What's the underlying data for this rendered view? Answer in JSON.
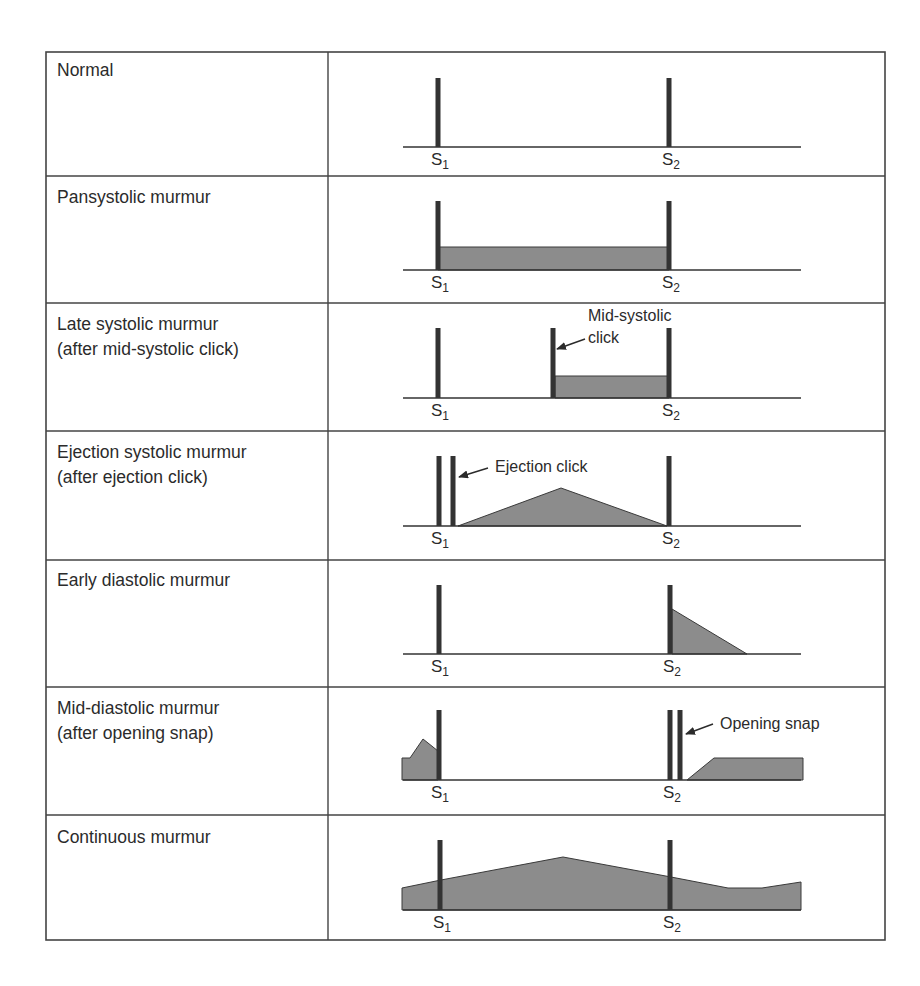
{
  "table": {
    "left": 46,
    "right": 885,
    "top": 52,
    "bottom": 940,
    "divider_x": 328,
    "row_lines": [
      176,
      303,
      431,
      560,
      687,
      815
    ],
    "border_color": "#444444"
  },
  "colors": {
    "bar": "#333333",
    "fill": "#8c8c8c",
    "fill_stroke": "#3a3a3a",
    "baseline": "#333333"
  },
  "rows": [
    {
      "label": "Normal",
      "label_top": 58,
      "baseline_y": 147,
      "bar_top": 78,
      "bars": [
        438,
        669
      ],
      "s1": {
        "text": "S",
        "sub": "1",
        "x": 431
      },
      "s2": {
        "text": "S",
        "sub": "2",
        "x": 662
      },
      "shapes": [],
      "annotations": []
    },
    {
      "label": "Pansystolic murmur",
      "label_top": 185,
      "baseline_y": 270,
      "bar_top": 201,
      "bars": [
        438,
        669
      ],
      "s1": {
        "text": "S",
        "sub": "1",
        "x": 431
      },
      "s2": {
        "text": "S",
        "sub": "2",
        "x": 662
      },
      "shapes": [
        "438,270 438,247 669,247 669,270"
      ],
      "annotations": []
    },
    {
      "label": "Late systolic murmur\n(after mid-systolic click)",
      "label_top": 312,
      "baseline_y": 398,
      "bar_top": 328,
      "bars": [
        438,
        553,
        669
      ],
      "s1": {
        "text": "S",
        "sub": "1",
        "x": 431
      },
      "s2": {
        "text": "S",
        "sub": "2",
        "x": 662
      },
      "shapes": [
        "555,398 555,376 669,376 669,398"
      ],
      "annotations": [
        {
          "text": "Mid-systolic\nclick",
          "x": 588,
          "y": 305,
          "arrow": {
            "x1": 585,
            "y1": 339,
            "x2": 557,
            "y2": 349
          }
        }
      ]
    },
    {
      "label": "Ejection systolic murmur\n(after ejection click)",
      "label_top": 440,
      "baseline_y": 526,
      "bar_top": 456,
      "bars": [
        439,
        453,
        669
      ],
      "s1": {
        "text": "S",
        "sub": "1",
        "x": 431
      },
      "s2": {
        "text": "S",
        "sub": "2",
        "x": 662
      },
      "shapes": [
        "458,526 561,488 667,526"
      ],
      "annotations": [
        {
          "text": "Ejection click",
          "x": 495,
          "y": 456,
          "arrow": {
            "x1": 488,
            "y1": 468,
            "x2": 459,
            "y2": 477
          }
        }
      ]
    },
    {
      "label": "Early diastolic murmur",
      "label_top": 568,
      "baseline_y": 654,
      "bar_top": 585,
      "bars": [
        439,
        670
      ],
      "s1": {
        "text": "S",
        "sub": "1",
        "x": 431
      },
      "s2": {
        "text": "S",
        "sub": "2",
        "x": 663
      },
      "shapes": [
        "672,654 672,609 747,654"
      ],
      "annotations": []
    },
    {
      "label": "Mid-diastolic murmur\n(after opening snap)",
      "label_top": 696,
      "baseline_y": 780,
      "bar_top": 710,
      "bars": [
        439,
        670,
        680
      ],
      "s1": {
        "text": "S",
        "sub": "1",
        "x": 431
      },
      "s2": {
        "text": "S",
        "sub": "2",
        "x": 663
      },
      "shapes": [
        "402,780 402,758 410,758 423,739 438,751 438,780",
        "687,780 714,758 803,758 803,780"
      ],
      "annotations": [
        {
          "text": "Opening snap",
          "x": 720,
          "y": 713,
          "arrow": {
            "x1": 713,
            "y1": 724,
            "x2": 686,
            "y2": 734
          }
        }
      ]
    },
    {
      "label": "Continuous murmur",
      "label_top": 825,
      "baseline_y": 910,
      "bar_top": 840,
      "bars": [
        440,
        670
      ],
      "s1": {
        "text": "S",
        "sub": "1",
        "x": 433
      },
      "s2": {
        "text": "S",
        "sub": "2",
        "x": 663
      },
      "shapes": [
        "402,910 402,888 441,880 563,857 671,877 728,888 762,888 801,882 801,910"
      ],
      "annotations": []
    }
  ],
  "baseline_x": [
    403,
    801
  ]
}
